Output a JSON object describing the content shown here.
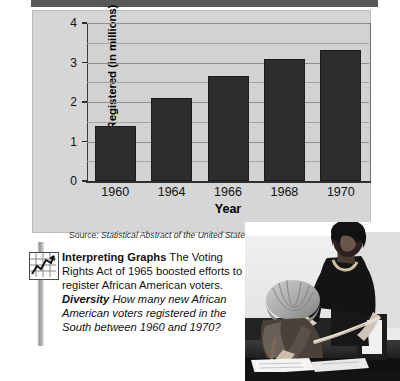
{
  "figure": {
    "source_prefix": "Source:",
    "source_title": "Statistical Abstract of the United States"
  },
  "chart_data": {
    "type": "bar",
    "title": "",
    "categories": [
      "1960",
      "1964",
      "1966",
      "1968",
      "1970"
    ],
    "values": [
      1.38,
      2.1,
      2.65,
      3.1,
      3.32
    ],
    "xlabel": "Year",
    "ylabel": "Number Registered (in millions)",
    "ylim": [
      0,
      4
    ],
    "ytick_labels": [
      "0",
      "1",
      "2",
      "3",
      "4"
    ],
    "ytick_values": [
      0,
      1,
      2,
      3,
      4
    ],
    "minor_gridline_values": [
      0.5,
      1.5,
      2.5,
      3.5
    ],
    "grid": true,
    "legend": "none",
    "bar_color": "#2b2b2b",
    "plot_background": "#d2d2d2",
    "panel_background": "#d6d6d6"
  },
  "caption": {
    "icon": "line-chart-icon",
    "heading": "Interpreting Graphs",
    "body_1": "The Voting Rights Act of 1965 boosted efforts to register African American voters.",
    "emphasis": "Diversity",
    "question": "How many new African American voters registered in the South between 1960 and 1970?"
  },
  "photo": {
    "alt": "Black and white photograph of an African American woman assisting a man seated at a table signing voter registration papers"
  }
}
